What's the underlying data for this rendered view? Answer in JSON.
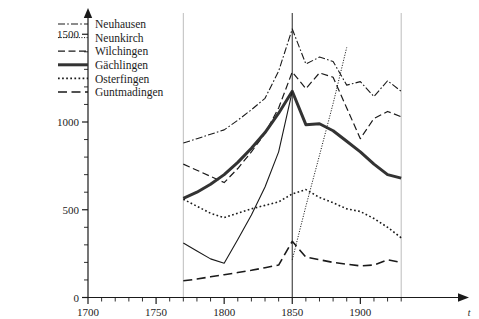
{
  "chart_data": {
    "type": "line",
    "title": "",
    "xlabel": "t",
    "ylabel": "",
    "xlim": [
      1700,
      1935
    ],
    "ylim": [
      0,
      1560
    ],
    "xticks": [
      1700,
      1750,
      1800,
      1850,
      1900
    ],
    "xticklabels": [
      "1700",
      "1750",
      "1800",
      "1850",
      "1900"
    ],
    "xminortick_step": 10,
    "yticks": [
      0,
      500,
      1000,
      1500
    ],
    "yticklabels": [
      "0",
      "500",
      "1000",
      "1500"
    ],
    "yminortick_step": 100,
    "grid": false,
    "legend_position": "upper-left",
    "marker_lines": [
      {
        "name": "vline-1770",
        "x": 1770,
        "color": "#b4b4b4"
      },
      {
        "name": "vline-1850",
        "x": 1850,
        "color": "#3a3a3a"
      },
      {
        "name": "vline-1930",
        "x": 1930,
        "color": "#b4b4b4"
      }
    ],
    "x": [
      1770,
      1780,
      1790,
      1800,
      1810,
      1820,
      1830,
      1840,
      1850,
      1860,
      1870,
      1880,
      1890,
      1900,
      1910,
      1920,
      1930
    ],
    "series": [
      {
        "name": "Neuhausen",
        "style": "dash-dot",
        "width": 1.1,
        "color": "#1a1a1a",
        "values": [
          880,
          905,
          930,
          955,
          1010,
          1070,
          1135,
          1290,
          1530,
          1330,
          1370,
          1345,
          1210,
          1230,
          1145,
          1235,
          1175
        ]
      },
      {
        "name": "Neunkirch",
        "style": "dotted-fine",
        "width": 1.0,
        "color": "#1a1a1a",
        "values": [
          null,
          null,
          null,
          null,
          null,
          null,
          null,
          null,
          215,
          520,
          810,
          1105,
          1425,
          null,
          null,
          null,
          null
        ]
      },
      {
        "name": "Wilchingen",
        "style": "dashed",
        "width": 1.2,
        "color": "#1a1a1a",
        "values": [
          760,
          725,
          690,
          655,
          735,
          830,
          935,
          1080,
          1285,
          1190,
          1280,
          1255,
          1080,
          905,
          1020,
          1060,
          1030
        ]
      },
      {
        "name": "Gächlingen",
        "style": "solid-thick",
        "width": 3.0,
        "color": "#333333",
        "values": [
          565,
          600,
          645,
          700,
          770,
          850,
          940,
          1050,
          1175,
          985,
          990,
          950,
          890,
          830,
          760,
          700,
          680
        ]
      },
      {
        "name": "Osterfingen",
        "style": "dotted",
        "width": 1.6,
        "color": "#1a1a1a",
        "values": [
          560,
          520,
          480,
          455,
          480,
          505,
          525,
          545,
          590,
          615,
          570,
          540,
          505,
          490,
          450,
          400,
          340
        ]
      },
      {
        "name": "Guntmadingen",
        "style": "long-dash",
        "width": 1.6,
        "color": "#1a1a1a",
        "values": [
          95,
          105,
          118,
          130,
          142,
          155,
          170,
          185,
          320,
          230,
          215,
          200,
          190,
          180,
          185,
          215,
          200
        ]
      },
      {
        "name": "Neunkirch-solid",
        "style": "solid-thin",
        "width": 1.1,
        "color": "#1a1a1a",
        "values": [
          310,
          265,
          220,
          195,
          330,
          470,
          630,
          830,
          1175,
          null,
          null,
          null,
          null,
          null,
          null,
          null,
          null
        ]
      }
    ]
  },
  "legend": {
    "items": [
      {
        "label": "Neuhausen",
        "style": "dash-dot"
      },
      {
        "label": "Neunkirch",
        "style": "dotted-fine"
      },
      {
        "label": "Wilchingen",
        "style": "dashed"
      },
      {
        "label": "Gächlingen",
        "style": "solid-thick"
      },
      {
        "label": "Osterfingen",
        "style": "dotted"
      },
      {
        "label": "Guntmadingen",
        "style": "long-dash"
      }
    ]
  }
}
